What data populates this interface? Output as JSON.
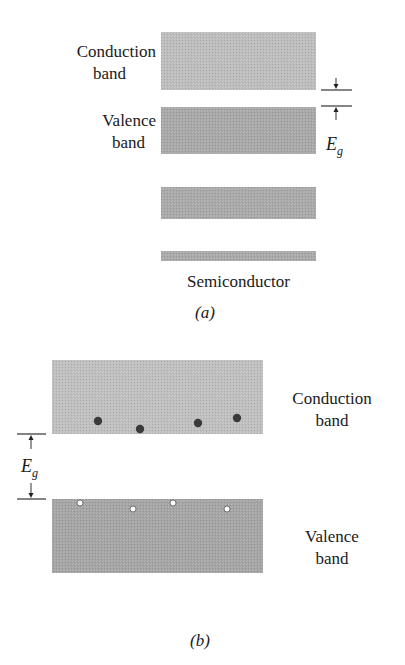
{
  "panel_a": {
    "caption": "(a)",
    "title": "Semiconductor",
    "labels": {
      "conduction_line1": "Conduction",
      "conduction_line2": "band",
      "valence_line1": "Valence",
      "valence_line2": "band",
      "gap_symbol": "E",
      "gap_subscript": "g"
    },
    "bands": [
      {
        "name": "conduction-band",
        "x": 161,
        "y": 32,
        "w": 155,
        "h": 58,
        "color": "#bdbdbd"
      },
      {
        "name": "valence-band",
        "x": 161,
        "y": 107,
        "w": 155,
        "h": 47,
        "color": "#a8a8a8"
      },
      {
        "name": "lower-band-1",
        "x": 161,
        "y": 187,
        "w": 155,
        "h": 32,
        "color": "#a9a9a9"
      },
      {
        "name": "lower-band-2",
        "x": 161,
        "y": 251,
        "w": 155,
        "h": 10,
        "color": "#a9a9a9"
      }
    ],
    "gap_marker": {
      "top_y": 90,
      "bottom_y": 106,
      "x1": 321,
      "x2": 352,
      "arrow_x": 336
    }
  },
  "panel_b": {
    "caption": "(b)",
    "labels": {
      "conduction_line1": "Conduction",
      "conduction_line2": "band",
      "valence_line1": "Valence",
      "valence_line2": "band",
      "gap_symbol": "E",
      "gap_subscript": "g"
    },
    "bands": [
      {
        "name": "conduction-band",
        "x": 52,
        "y": 360,
        "w": 211,
        "h": 74,
        "color": "#bfbfbf"
      },
      {
        "name": "valence-band",
        "x": 52,
        "y": 499,
        "w": 211,
        "h": 74,
        "color": "#a5a5a5"
      }
    ],
    "electrons": [
      {
        "x": 98,
        "y": 421
      },
      {
        "x": 140,
        "y": 429
      },
      {
        "x": 198,
        "y": 423
      },
      {
        "x": 237,
        "y": 418
      }
    ],
    "holes": [
      {
        "x": 80,
        "y": 503
      },
      {
        "x": 133,
        "y": 509
      },
      {
        "x": 173,
        "y": 503
      },
      {
        "x": 227,
        "y": 509
      }
    ],
    "gap_marker": {
      "top_y": 434,
      "bottom_y": 499,
      "x1": 17,
      "x2": 46,
      "arrow_x": 31
    },
    "colors": {
      "electron": "#3a3a3a",
      "hole_fill": "#ffffff",
      "hole_stroke": "#555555"
    }
  }
}
